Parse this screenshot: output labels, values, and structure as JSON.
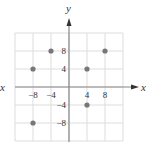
{
  "chart_data": {
    "type": "scatter",
    "title": "",
    "xlabel": "x",
    "ylabel": "y",
    "xlim": [
      -12,
      12
    ],
    "ylim": [
      -12,
      12
    ],
    "grid": true,
    "grid_step": 4,
    "x_ticks": [
      -8,
      -4,
      4,
      8
    ],
    "y_ticks": [
      8,
      4,
      -4,
      -8
    ],
    "x_tick_labels": [
      "−8",
      "−4",
      "4",
      "8"
    ],
    "y_tick_labels": [
      "8",
      "4",
      "−4",
      "−8"
    ],
    "points": [
      {
        "x": -4,
        "y": 8
      },
      {
        "x": 8,
        "y": 8
      },
      {
        "x": -8,
        "y": 4
      },
      {
        "x": 4,
        "y": 4
      },
      {
        "x": 4,
        "y": -4
      },
      {
        "x": -8,
        "y": -8
      }
    ],
    "stray_label": "x",
    "colors": {
      "grid": "#dddddd",
      "axis": "#888888",
      "point": "#777777",
      "text": "#333333"
    }
  }
}
